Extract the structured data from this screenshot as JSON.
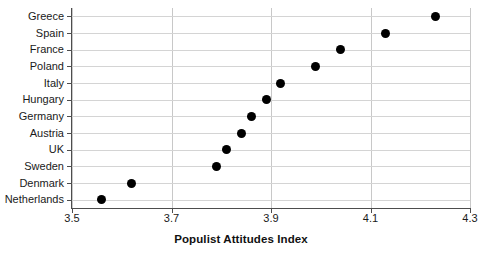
{
  "chart_data": {
    "type": "scatter",
    "title": "",
    "xlabel": "Populist Attitudes Index",
    "ylabel": "",
    "xlim": [
      3.5,
      4.3
    ],
    "xticks": [
      "3.5",
      "3.7",
      "3.9",
      "4.1",
      "4.3"
    ],
    "xtick_values": [
      3.5,
      3.7,
      3.9,
      4.1,
      4.3
    ],
    "grid": "both",
    "legend": "none",
    "orientation": "horizontal",
    "categories": [
      "Greece",
      "Spain",
      "France",
      "Poland",
      "Italy",
      "Hungary",
      "Germany",
      "Austria",
      "UK",
      "Sweden",
      "Denmark",
      "Netherlands"
    ],
    "values": [
      4.23,
      4.13,
      4.04,
      3.99,
      3.92,
      3.89,
      3.86,
      3.84,
      3.81,
      3.79,
      3.62,
      3.56
    ],
    "points": [
      {
        "category": "Greece",
        "value": 4.23
      },
      {
        "category": "Spain",
        "value": 4.13
      },
      {
        "category": "France",
        "value": 4.04
      },
      {
        "category": "Poland",
        "value": 3.99
      },
      {
        "category": "Italy",
        "value": 3.92
      },
      {
        "category": "Hungary",
        "value": 3.89
      },
      {
        "category": "Germany",
        "value": 3.86
      },
      {
        "category": "Austria",
        "value": 3.84
      },
      {
        "category": "UK",
        "value": 3.81
      },
      {
        "category": "Sweden",
        "value": 3.79
      },
      {
        "category": "Denmark",
        "value": 3.62
      },
      {
        "category": "Netherlands",
        "value": 3.56
      }
    ],
    "marker_color": "#000000",
    "gridline_color": "#d4d4d4",
    "axis_color": "#4d4d4d",
    "background_color": "#ffffff"
  }
}
